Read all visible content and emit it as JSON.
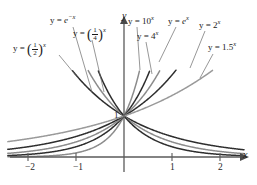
{
  "chart_data": {
    "type": "line",
    "title": "",
    "xlabel": "x",
    "ylabel": "y",
    "xlim": [
      -2.45,
      2.55
    ],
    "ylim": [
      -0.22,
      2.15
    ],
    "grid": false,
    "legend": "inline-curve-labels",
    "x_ticks": [
      -2,
      -1,
      1,
      2
    ],
    "x_tick_labels": [
      "−2",
      "−1",
      "1",
      "2"
    ],
    "y_ticks": [
      1
    ],
    "y_tick_labels": [
      "1"
    ],
    "common_point": {
      "x": 0,
      "y": 1
    },
    "series": [
      {
        "name": "y = (1/2)^x",
        "base": 0.5,
        "color": "#2e2e2e",
        "width": 1.5,
        "label_key": "half"
      },
      {
        "name": "y = e^-x",
        "base": 0.36787944117,
        "color": "#8c8c8c",
        "width": 1.5,
        "label_key": "e_neg"
      },
      {
        "name": "y = (1/4)^x",
        "base": 0.25,
        "color": "#2e2e2e",
        "width": 1.5,
        "label_key": "quarter"
      },
      {
        "name": "y = 10^x",
        "base": 10,
        "color": "#8c8c8c",
        "width": 1.5,
        "label_key": "ten"
      },
      {
        "name": "y = 4^x",
        "base": 4,
        "color": "#2e2e2e",
        "width": 1.5,
        "label_key": "four"
      },
      {
        "name": "y = e^x",
        "base": 2.71828182846,
        "color": "#8c8c8c",
        "width": 1.5,
        "label_key": "e_pos"
      },
      {
        "name": "y = 2^x",
        "base": 2,
        "color": "#2e2e2e",
        "width": 1.5,
        "label_key": "two"
      },
      {
        "name": "y = 1.5^x",
        "base": 1.5,
        "color": "#9a9a9a",
        "width": 1.5,
        "label_key": "onefive"
      }
    ]
  },
  "labels": {
    "half": {
      "lhs": "y =",
      "open": "(",
      "num": "1",
      "den": "2",
      "close": ")",
      "exp": "x"
    },
    "e_neg": {
      "lhs": "y =",
      "base": "e",
      "exp": "−x"
    },
    "quarter": {
      "lhs": "y =",
      "open": "(",
      "num": "1",
      "den": "4",
      "close": ")",
      "exp": "x"
    },
    "ten": {
      "lhs": "y =",
      "base": "10",
      "exp": "x"
    },
    "four": {
      "lhs": "y =",
      "base": "4",
      "exp": "x"
    },
    "e_pos": {
      "lhs": "y =",
      "base": "e",
      "exp": "x"
    },
    "two": {
      "lhs": "y =",
      "base": "2",
      "exp": "x"
    },
    "onefive": {
      "lhs": "y =",
      "base": "1.5",
      "exp": "x"
    }
  },
  "axes": {
    "x_axis_label": "x",
    "y_axis_label": "y",
    "unit_marker": "1"
  },
  "ticks": {
    "neg_two": "−2",
    "neg_one": "−1",
    "pos_one": "1",
    "pos_two": "2"
  },
  "colors": {
    "dark_curve": "#2e2e2e",
    "light_curve": "#8c8c8c",
    "axis": "#5a5a5a",
    "text": "#1a1a1a",
    "background": "#ffffff"
  }
}
